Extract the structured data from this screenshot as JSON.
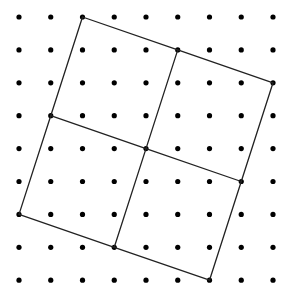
{
  "diagram": {
    "type": "dot-grid-geometry",
    "grid": {
      "cols": 9,
      "rows": 9,
      "origin_x": 19,
      "origin_y": 17,
      "spacing_x": 31.75,
      "spacing_y": 32.9,
      "dot_radius": 2.6,
      "dot_color": "#000000"
    },
    "line_color": "#222222",
    "line_width": 1.3,
    "vertices": {
      "A": [
        2,
        0
      ],
      "B": [
        5,
        1
      ],
      "C": [
        8,
        2
      ],
      "D": [
        7,
        5
      ],
      "E": [
        6,
        8
      ],
      "F": [
        3,
        7
      ],
      "G": [
        0,
        6
      ],
      "H": [
        1,
        3
      ],
      "O": [
        4,
        4
      ]
    },
    "segments": [
      [
        "A",
        "B"
      ],
      [
        "B",
        "C"
      ],
      [
        "C",
        "D"
      ],
      [
        "D",
        "E"
      ],
      [
        "E",
        "F"
      ],
      [
        "F",
        "G"
      ],
      [
        "G",
        "H"
      ],
      [
        "H",
        "A"
      ],
      [
        "H",
        "O"
      ],
      [
        "O",
        "D"
      ],
      [
        "B",
        "O"
      ],
      [
        "O",
        "F"
      ]
    ]
  }
}
